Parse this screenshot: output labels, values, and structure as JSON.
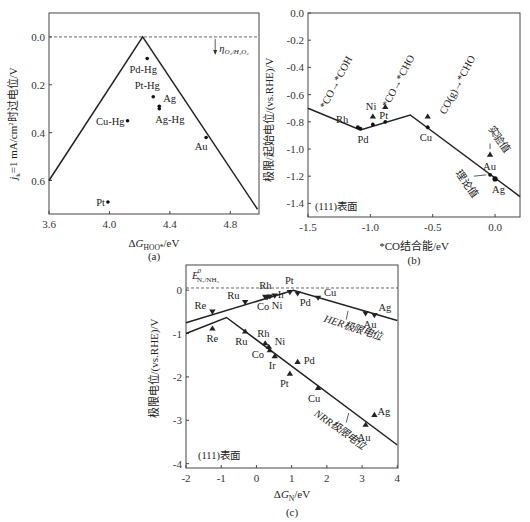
{
  "chart_data": [
    {
      "id": "a",
      "type": "scatter",
      "panel_label": "(a)",
      "xlabel": "ΔG_HOO*/eV",
      "xlabel_main": "ΔG",
      "xlabel_sub": "HOO*",
      "xlabel_tail": "/eV",
      "ylabel": "j_k=1 mA/cm²时过电位/V",
      "ylabel_parts": {
        "j": "j",
        "sub": "k",
        "mid": "=1 mA/cm",
        "sup": "2",
        "tail": "时过电位/V"
      },
      "xlim": [
        3.6,
        5.0
      ],
      "ylim": [
        0.72,
        -0.08
      ],
      "y_inverted": true,
      "xticks": [
        3.6,
        4.0,
        4.4,
        4.8
      ],
      "xtick_labels": [
        "3.6",
        "4.0",
        "4.4",
        "4.8"
      ],
      "yticks": [
        0.0,
        0.2,
        0.4,
        0.6
      ],
      "ytick_labels": [
        "0.0",
        "0.2",
        "0.4",
        "0.6"
      ],
      "reference_line": {
        "y": 0.0,
        "style": "dashed"
      },
      "annotation": {
        "text": "η",
        "sub": "O₂/H₂O₂",
        "x": 4.7,
        "y": 0.0,
        "arrow": "down"
      },
      "volcano": [
        [
          3.6,
          0.6
        ],
        [
          4.22,
          0.0
        ],
        [
          4.98,
          0.72
        ]
      ],
      "points": [
        {
          "label": "Pd-Hg",
          "x": 4.25,
          "y": 0.09,
          "label_pos": "below"
        },
        {
          "label": "Pt-Hg",
          "x": 4.29,
          "y": 0.25,
          "label_pos": "above-left"
        },
        {
          "label": "Ag",
          "x": 4.33,
          "y": 0.29,
          "label_pos": "right-above"
        },
        {
          "label": "Ag-Hg",
          "x": 4.33,
          "y": 0.3,
          "label_pos": "below-right"
        },
        {
          "label": "Cu-Hg",
          "x": 4.12,
          "y": 0.35,
          "label_pos": "left"
        },
        {
          "label": "Au",
          "x": 4.64,
          "y": 0.42,
          "label_pos": "below-left"
        },
        {
          "label": "Pt",
          "x": 3.99,
          "y": 0.69,
          "label_pos": "left"
        }
      ]
    },
    {
      "id": "b",
      "type": "scatter",
      "panel_label": "(b)",
      "xlabel": "*CO结合能/eV",
      "ylabel": "极限/起始电位/(vs.RHE)/V",
      "xlim": [
        -1.5,
        0.2
      ],
      "ylim": [
        -1.5,
        0.0
      ],
      "xticks": [
        -1.5,
        -1.0,
        -0.5,
        0.0
      ],
      "xtick_labels": [
        "-1.5",
        "-1.0",
        "-0.5",
        "0.0"
      ],
      "yticks": [
        0.0,
        -0.2,
        -0.4,
        -0.6,
        -0.8,
        -1.0,
        -1.2,
        -1.4
      ],
      "ytick_labels": [
        "0.0",
        "-0.2",
        "-0.4",
        "-0.6",
        "-0.8",
        "-1.0",
        "-1.2",
        "-1.4"
      ],
      "surface_label": "(111)表面",
      "limit_line": [
        [
          -1.5,
          -0.7
        ],
        [
          -1.08,
          -0.86
        ],
        [
          -0.68,
          -0.75
        ],
        [
          0.2,
          -1.35
        ]
      ],
      "theory_points": [
        {
          "label": "Rh",
          "x": -1.1,
          "y": -0.84
        },
        {
          "label": "Pd",
          "x": -1.08,
          "y": -0.85
        },
        {
          "label": "",
          "x": -0.98,
          "y": -0.82
        },
        {
          "label": "",
          "x": -0.88,
          "y": -0.8
        },
        {
          "label": "Cu",
          "x": -0.54,
          "y": -0.84
        },
        {
          "label": "",
          "x": -0.04,
          "y": -1.19
        },
        {
          "label": "Ag",
          "x": 0.0,
          "y": -1.22
        }
      ],
      "experiment_points": [
        {
          "label": "Ni",
          "x": -0.98,
          "y": -0.76
        },
        {
          "label": "Pt",
          "x": -0.88,
          "y": -0.69
        },
        {
          "label": "",
          "x": -0.54,
          "y": -0.76
        },
        {
          "label": "Au",
          "x": -0.04,
          "y": -1.04
        }
      ],
      "reaction_labels": [
        "*CO→*COH",
        "*CO→*CHO",
        "CO(g)→*CHO"
      ],
      "callouts": {
        "experiment": "实验值",
        "theory": "理论值"
      }
    },
    {
      "id": "c",
      "type": "scatter",
      "panel_label": "(c)",
      "xlabel": "ΔG_N/eV",
      "xlabel_main": "ΔG",
      "xlabel_sub": "N",
      "xlabel_tail": "/eV",
      "ylabel": "极限电位/(vs.RHE)/V",
      "xlim": [
        -2,
        4
      ],
      "ylim": [
        -4.1,
        0.6
      ],
      "xticks": [
        -2,
        -1,
        0,
        1,
        2,
        3,
        4
      ],
      "xtick_labels": [
        "-2",
        "-1",
        "0",
        "1",
        "2",
        "3",
        "4"
      ],
      "yticks": [
        0,
        -1,
        -2,
        -3,
        -4
      ],
      "ytick_labels": [
        "0",
        "-1",
        "-2",
        "-3",
        "-4"
      ],
      "surface_label": "(111)表面",
      "reference": {
        "text": "E",
        "sup": "0",
        "sub": "N₂/NH₃",
        "y": 0.05
      },
      "her_line": [
        [
          -2,
          -0.75
        ],
        [
          1.05,
          0.0
        ],
        [
          4,
          -0.7
        ]
      ],
      "nrr_line": [
        [
          -2,
          -1.0
        ],
        [
          -0.85,
          -0.63
        ],
        [
          4,
          -3.57
        ]
      ],
      "her_label": "HER极限电位",
      "nrr_label": "NRR极限电位",
      "her_points": [
        {
          "label": "Re",
          "x": -1.25,
          "y": -0.5
        },
        {
          "label": "Ru",
          "x": -0.32,
          "y": -0.28
        },
        {
          "label": "Rh",
          "x": 0.25,
          "y": -0.16
        },
        {
          "label": "Co",
          "x": 0.3,
          "y": -0.17
        },
        {
          "label": "Ni",
          "x": 0.38,
          "y": -0.15
        },
        {
          "label": "Ir",
          "x": 0.52,
          "y": -0.13
        },
        {
          "label": "Pt",
          "x": 0.95,
          "y": -0.05
        },
        {
          "label": "Pd",
          "x": 1.17,
          "y": -0.08
        },
        {
          "label": "Cu",
          "x": 1.75,
          "y": -0.18
        },
        {
          "label": "Au",
          "x": 3.1,
          "y": -0.54
        },
        {
          "label": "Ag",
          "x": 3.35,
          "y": -0.58
        }
      ],
      "nrr_points": [
        {
          "label": "Re",
          "x": -1.25,
          "y": -0.88
        },
        {
          "label": "Ru",
          "x": -0.32,
          "y": -0.95
        },
        {
          "label": "Rh",
          "x": 0.25,
          "y": -1.22
        },
        {
          "label": "Ni",
          "x": 0.35,
          "y": -1.3
        },
        {
          "label": "Co",
          "x": 0.38,
          "y": -1.38
        },
        {
          "label": "Ir",
          "x": 0.52,
          "y": -1.52
        },
        {
          "label": "Pt",
          "x": 0.95,
          "y": -1.92
        },
        {
          "label": "Pd",
          "x": 1.17,
          "y": -1.65
        },
        {
          "label": "Cu",
          "x": 1.75,
          "y": -2.25
        },
        {
          "label": "Au",
          "x": 3.1,
          "y": -3.1
        },
        {
          "label": "Ag",
          "x": 3.35,
          "y": -2.87
        }
      ]
    }
  ]
}
